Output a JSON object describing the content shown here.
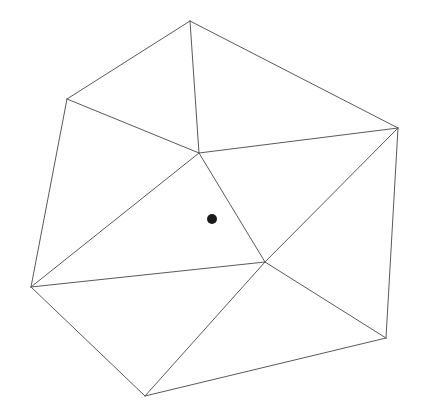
{
  "figure": {
    "name": "triangulated-polygon-with-interior-point",
    "type": "geometry-diagram",
    "title": "",
    "caption": "",
    "canvas": {
      "width": 433,
      "height": 415,
      "background": "#ffffff"
    },
    "style": {
      "edge_color": "#5a5a5a",
      "edge_width": 1,
      "face_fill": "#ffffff",
      "point_color": "#1a1a1a"
    },
    "vertices": [
      {
        "id": "v0",
        "label": "",
        "role": "boundary",
        "x": 190,
        "y": 21
      },
      {
        "id": "v1",
        "label": "",
        "role": "boundary",
        "x": 398,
        "y": 128
      },
      {
        "id": "v2",
        "label": "",
        "role": "boundary",
        "x": 386,
        "y": 338
      },
      {
        "id": "v3",
        "label": "",
        "role": "boundary",
        "x": 145,
        "y": 396
      },
      {
        "id": "v4",
        "label": "",
        "role": "boundary",
        "x": 31,
        "y": 287
      },
      {
        "id": "v5",
        "label": "",
        "role": "boundary",
        "x": 67,
        "y": 99
      },
      {
        "id": "c0",
        "label": "",
        "role": "interior",
        "x": 199,
        "y": 153
      },
      {
        "id": "c1",
        "label": "",
        "role": "interior",
        "x": 265,
        "y": 262
      }
    ],
    "boundary_path": "190,21 398,128 386,338 145,396 31,287 67,99",
    "edges": [
      {
        "id": "e0",
        "from": "v5",
        "to": "v0",
        "kind": "boundary",
        "path": "M 67 99 L 190 21"
      },
      {
        "id": "e1",
        "from": "v0",
        "to": "v1",
        "kind": "boundary",
        "path": "M 190 21 L 398 128"
      },
      {
        "id": "e2",
        "from": "v1",
        "to": "v2",
        "kind": "boundary",
        "path": "M 398 128 L 386 338"
      },
      {
        "id": "e3",
        "from": "v2",
        "to": "v3",
        "kind": "boundary",
        "path": "M 386 338 L 145 396"
      },
      {
        "id": "e4",
        "from": "v3",
        "to": "v4",
        "kind": "boundary",
        "path": "M 145 396 L 31 287"
      },
      {
        "id": "e5",
        "from": "v4",
        "to": "v5",
        "kind": "boundary",
        "path": "M 31 287 L 67 99"
      },
      {
        "id": "e6",
        "from": "v0",
        "to": "c0",
        "kind": "interior",
        "path": "M 190 21 L 199 153"
      },
      {
        "id": "e7",
        "from": "v5",
        "to": "c0",
        "kind": "interior",
        "path": "M 67 99 L 199 153"
      },
      {
        "id": "e8",
        "from": "v1",
        "to": "c0",
        "kind": "interior",
        "path": "M 398 128 L 199 153"
      },
      {
        "id": "e9",
        "from": "v4",
        "to": "c0",
        "kind": "interior",
        "path": "M 31 287 L 199 153"
      },
      {
        "id": "e10",
        "from": "c0",
        "to": "c1",
        "kind": "interior",
        "path": "M 199 153 L 265 262"
      },
      {
        "id": "e11",
        "from": "v4",
        "to": "c1",
        "kind": "interior",
        "path": "M 31 287 L 265 262"
      },
      {
        "id": "e12",
        "from": "v1",
        "to": "c1",
        "kind": "interior",
        "path": "M 398 128 L 265 262"
      },
      {
        "id": "e13",
        "from": "v2",
        "to": "c1",
        "kind": "interior",
        "path": "M 386 338 L 265 262"
      },
      {
        "id": "e14",
        "from": "v3",
        "to": "c1",
        "kind": "interior",
        "path": "M 145 396 L 265 262"
      }
    ],
    "faces": [
      {
        "id": "f0",
        "vertices": "v5 v0 c0",
        "points": "67,99 190,21 199,153"
      },
      {
        "id": "f1",
        "vertices": "v0 v1 c0",
        "points": "190,21 398,128 199,153"
      },
      {
        "id": "f2",
        "vertices": "v5 c0 v4",
        "points": "67,99 199,153 31,287"
      },
      {
        "id": "f3",
        "vertices": "c0 c1 v4",
        "points": "199,153 265,262 31,287"
      },
      {
        "id": "f4",
        "vertices": "c0 v1 c1",
        "points": "199,153 398,128 265,262"
      },
      {
        "id": "f5",
        "vertices": "v1 v2 c1",
        "points": "398,128 386,338 265,262"
      },
      {
        "id": "f6",
        "vertices": "c1 v2 v3",
        "points": "265,262 386,338 145,396"
      },
      {
        "id": "f7",
        "vertices": "v4 c1 v3",
        "points": "31,287 265,262 145,396"
      }
    ],
    "marked_points": [
      {
        "id": "p0",
        "label": "",
        "x": 212,
        "y": 219,
        "radius": 5,
        "color": "#1a1a1a"
      }
    ],
    "counts": {
      "boundary_vertices": 6,
      "interior_vertices": 2,
      "edges": 15,
      "triangles": 8,
      "marked_points": 1
    }
  }
}
